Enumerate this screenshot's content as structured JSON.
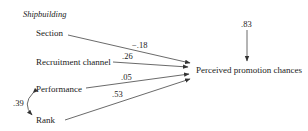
{
  "diagram": {
    "title": "Shipbuilding",
    "predictors": [
      {
        "label": "Section",
        "coefficient": "−.18"
      },
      {
        "label": "Recruitment channel",
        "coefficient": ".26"
      },
      {
        "label": "Performance",
        "coefficient": ".05"
      },
      {
        "label": "Rank",
        "coefficient": ".53"
      }
    ],
    "outcome": {
      "label": "Perceived promotion chances",
      "residual": ".83"
    },
    "correlation": {
      "between": [
        "Performance",
        "Rank"
      ],
      "value": ".39"
    }
  }
}
